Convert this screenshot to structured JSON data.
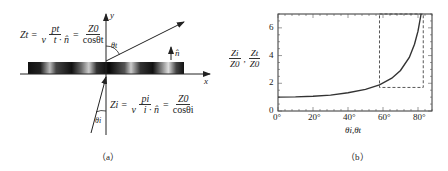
{
  "panel_a": {
    "caption": "（a）",
    "y_axis_label": "y",
    "x_axis_label": "x",
    "normal_label": "n̂",
    "theta_top": "θt",
    "theta_bottom": "θi",
    "eq_top": {
      "lhs": "Zt =",
      "num1": "pt",
      "den1": "v⃗t · n̂",
      "eq2": "=",
      "num2": "Z0",
      "den2": "cosθt"
    },
    "eq_bottom": {
      "lhs": "Zi =",
      "num1": "pi",
      "den1": "v⃗i · n̂",
      "eq2": "=",
      "num2": "Z0",
      "den2": "cosθi"
    }
  },
  "panel_b": {
    "caption": "（b）",
    "ylabel_num1": "Zi",
    "ylabel_den1": "Z0",
    "ylabel_sep": ",",
    "ylabel_num2": "Zt",
    "ylabel_den2": "Z0",
    "xlabel": "θi,θt",
    "yticks": [
      "0",
      "2",
      "4",
      "6"
    ],
    "xticks": [
      "0°",
      "20°",
      "40°",
      "60°",
      "80°"
    ]
  },
  "chart_data": {
    "type": "line",
    "title": "",
    "xlabel": "θi, θt",
    "ylabel": "Zi/Z0, Zt/Z0",
    "xlim": [
      0,
      88
    ],
    "ylim": [
      0,
      7
    ],
    "x": [
      0,
      10,
      20,
      30,
      40,
      50,
      58,
      65,
      70,
      75,
      78,
      80,
      81.8
    ],
    "series": [
      {
        "name": "1/cosθ",
        "values": [
          1.0,
          1.02,
          1.06,
          1.15,
          1.31,
          1.56,
          1.89,
          2.37,
          2.92,
          3.86,
          4.81,
          5.76,
          7.0
        ]
      }
    ],
    "annotations": [
      {
        "type": "dashed-rectangle",
        "x_range": [
          58,
          83
        ],
        "y_range": [
          1.7,
          7
        ]
      }
    ],
    "grid": false,
    "legend": "none"
  }
}
